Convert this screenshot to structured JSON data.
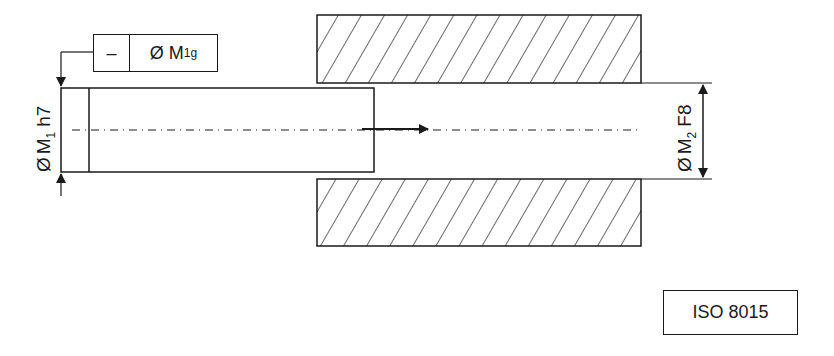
{
  "drawing": {
    "colors": {
      "line": "#1a1a1a",
      "background": "#ffffff"
    },
    "feature_control_frame": {
      "symbol": "–",
      "symbol_name": "straightness",
      "tolerance_prefix": "Ø",
      "tolerance_main": "M",
      "tolerance_sub": "1g"
    },
    "shaft_dimension": {
      "prefix": "Ø",
      "main": "M",
      "sub": "1",
      "fit": "h7"
    },
    "hole_dimension": {
      "prefix": "Ø",
      "main": "M",
      "sub": "2",
      "fit": "F8"
    },
    "standard_reference": "ISO 8015",
    "parts": [
      "shaft",
      "bore-housing-top",
      "bore-housing-bottom"
    ],
    "insertion_arrow": "arrow-right"
  }
}
